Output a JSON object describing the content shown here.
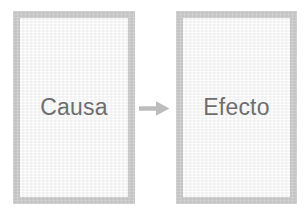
{
  "diagram": {
    "type": "cause-effect-flow",
    "background_color": "#ffffff",
    "node_border_color": "#c9c9c9",
    "node_fill_color": "#ffffff",
    "label_color": "#6e6e6e",
    "arrow_color": "#bdbdbd",
    "nodes": [
      {
        "id": "cause",
        "label": "Causa",
        "shape": "rectangle",
        "x": 13,
        "y": 11,
        "width": 122,
        "height": 193
      },
      {
        "id": "effect",
        "label": "Efecto",
        "shape": "rectangle",
        "x": 176,
        "y": 11,
        "width": 121,
        "height": 193
      }
    ],
    "connectors": [
      {
        "id": "cause-to-effect",
        "icon": "block-arrow-right-icon",
        "from": "cause",
        "to": "effect",
        "direction": "right"
      }
    ]
  }
}
